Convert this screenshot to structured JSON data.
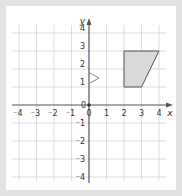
{
  "chart_data": {
    "type": "coordinate-grid",
    "xlabel": "x",
    "ylabel": "y",
    "xlim": [
      -4,
      4
    ],
    "ylim": [
      -4,
      4
    ],
    "x_ticks": [
      "-4",
      "-3",
      "-2",
      "-1",
      "0",
      "1",
      "2",
      "3",
      "4"
    ],
    "y_ticks": [
      "4",
      "3",
      "2",
      "1",
      "0",
      "-1",
      "-2",
      "-3",
      "-4"
    ],
    "grid": true,
    "shapes": [
      {
        "name": "trapezium",
        "vertices": [
          [
            2,
            1
          ],
          [
            2,
            3
          ],
          [
            4,
            3
          ],
          [
            3,
            1
          ]
        ],
        "fill": "#d9d9d9",
        "stroke": "#555555"
      }
    ],
    "annotations": [
      {
        "type": "arrow-marker",
        "description": "small open triangle on y-axis pointing right",
        "at": [
          0,
          1.5
        ]
      }
    ]
  },
  "labels": {
    "x_axis": "x",
    "y_axis": "y",
    "origin_y": "0",
    "origin_x": "0"
  }
}
